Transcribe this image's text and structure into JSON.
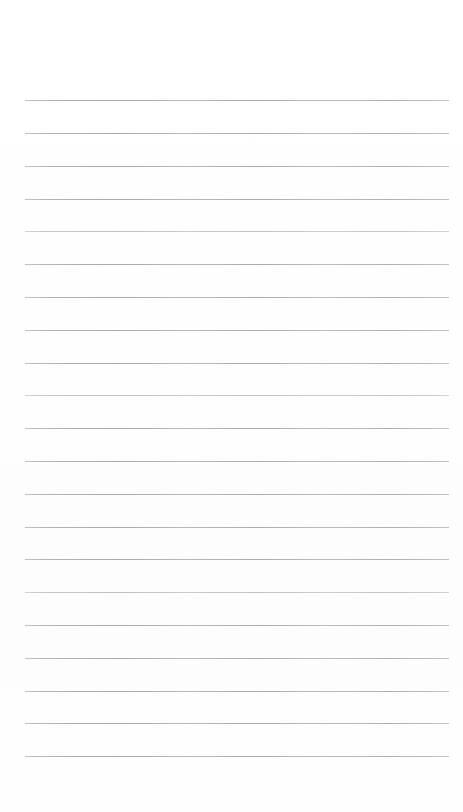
{
  "document": {
    "kind": "lined-notebook-page",
    "title": "Blank ruled page",
    "page_width": 463,
    "page_height": 812,
    "background_color": "#fefefe",
    "has_text": false,
    "text_content": "",
    "heading": "",
    "page_number": ""
  },
  "ruling": {
    "style": "horizontal-ruled",
    "line_color": "#b9babb",
    "line_thickness_px": 1,
    "line_count": 21,
    "first_line_y": 100,
    "line_spacing_px": 32.8,
    "line_start_x": 25,
    "line_end_x": 449,
    "top_margin_px": 100,
    "bottom_margin_px": 56,
    "left_margin_px": 25,
    "right_margin_px": 14,
    "has_vertical_margin_rule": false,
    "lines": [
      {
        "index": 1,
        "y": 100,
        "weight": "normal"
      },
      {
        "index": 2,
        "y": 133,
        "weight": "normal"
      },
      {
        "index": 3,
        "y": 166,
        "weight": "normal"
      },
      {
        "index": 4,
        "y": 199,
        "weight": "normal"
      },
      {
        "index": 5,
        "y": 231,
        "weight": "faint"
      },
      {
        "index": 6,
        "y": 264,
        "weight": "normal"
      },
      {
        "index": 7,
        "y": 297,
        "weight": "normal"
      },
      {
        "index": 8,
        "y": 330,
        "weight": "normal"
      },
      {
        "index": 9,
        "y": 363,
        "weight": "normal"
      },
      {
        "index": 10,
        "y": 395,
        "weight": "faint"
      },
      {
        "index": 11,
        "y": 428,
        "weight": "normal"
      },
      {
        "index": 12,
        "y": 461,
        "weight": "normal"
      },
      {
        "index": 13,
        "y": 494,
        "weight": "normal"
      },
      {
        "index": 14,
        "y": 527,
        "weight": "normal"
      },
      {
        "index": 15,
        "y": 559,
        "weight": "normal"
      },
      {
        "index": 16,
        "y": 592,
        "weight": "faint"
      },
      {
        "index": 17,
        "y": 625,
        "weight": "normal"
      },
      {
        "index": 18,
        "y": 658,
        "weight": "normal"
      },
      {
        "index": 19,
        "y": 691,
        "weight": "normal"
      },
      {
        "index": 20,
        "y": 723,
        "weight": "normal"
      },
      {
        "index": 21,
        "y": 756,
        "weight": "normal"
      }
    ]
  }
}
